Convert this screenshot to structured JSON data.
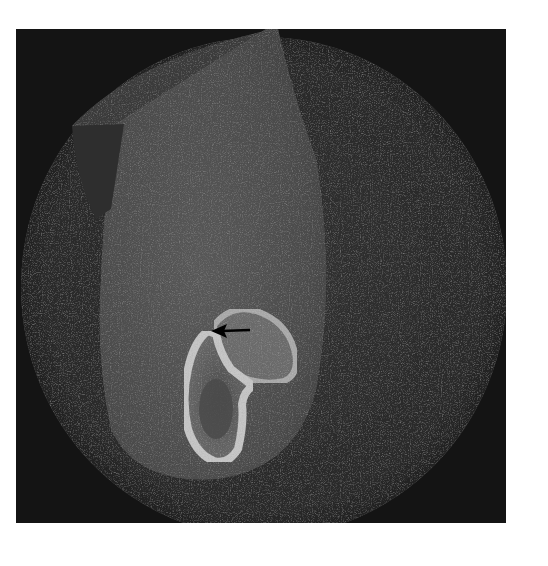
{
  "image": {
    "type": "CBCT cross-sectional scan (grayscale)",
    "description": "Circular field of view containing a soft-tissue oval region with a bright teardrop-shaped bony outline; a black arrow points left at a junction between two bony structures."
  },
  "annotations": [
    {
      "kind": "arrow",
      "direction": "left",
      "color": "#000000",
      "tail": [
        250,
        330
      ],
      "head": [
        212,
        331
      ]
    }
  ],
  "colors": {
    "background_margin": "#ffffff",
    "frame_background": "#141414",
    "field_of_view": "#2a2a2a",
    "soft_tissue": "#4a4a4a",
    "bone_bright": "#bdbdbd",
    "arrow": "#000000"
  }
}
